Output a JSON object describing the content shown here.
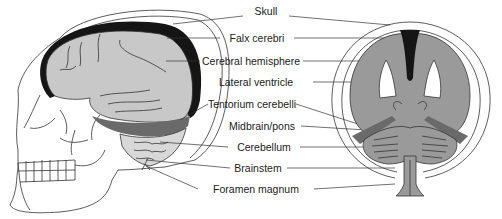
{
  "colors": {
    "outline": "#333333",
    "brain_fill": "#c8c8c8",
    "coronal_fill": "#9a9a9a",
    "dura": "#151515",
    "tentorium": "#6a6a6a",
    "background": "#ffffff"
  },
  "labels": [
    {
      "id": "skull",
      "text": "Skull",
      "x": 251,
      "y": 11
    },
    {
      "id": "falx-cerebri",
      "text": "Falx cerebri",
      "x": 251,
      "y": 34
    },
    {
      "id": "cerebral-hemisphere",
      "text": "Cerebral hemisphere",
      "x": 251,
      "y": 56
    },
    {
      "id": "lateral-ventricle",
      "text": "Lateral ventricle",
      "x": 251,
      "y": 78
    },
    {
      "id": "tentorium-cerebelli",
      "text": "Tentorium cerebelli",
      "x": 251,
      "y": 100
    },
    {
      "id": "midbrain-pons",
      "text": "Midbrain/pons",
      "x": 251,
      "y": 122
    },
    {
      "id": "cerebellum",
      "text": "Cerebellum",
      "x": 251,
      "y": 143
    },
    {
      "id": "brainstem",
      "text": "Brainstem",
      "x": 251,
      "y": 164
    },
    {
      "id": "foramen-magnum",
      "text": "Foramen magnum",
      "x": 251,
      "y": 185
    }
  ]
}
